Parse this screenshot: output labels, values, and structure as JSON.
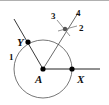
{
  "diagram": {
    "type": "angle-bisector-construction",
    "points": {
      "A": {
        "label": "A",
        "x": 43,
        "y": 69
      },
      "X": {
        "label": "X",
        "x": 72,
        "y": 69
      },
      "Y": {
        "label": "Y",
        "x": 28,
        "y": 42
      },
      "P": {
        "label": "",
        "x": 65,
        "y": 29
      }
    },
    "step_labels": {
      "s1": "1",
      "s2": "2",
      "s3": "3",
      "s4": "4"
    },
    "colors": {
      "line": "#222222",
      "circle": "#666666",
      "arc": "#777777",
      "point": "#000000",
      "intersection": "#555555"
    }
  }
}
